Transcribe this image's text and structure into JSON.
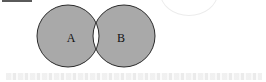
{
  "diagram": {
    "type": "venn",
    "operation": "symmetric-difference",
    "sets": [
      {
        "id": "A",
        "label": "A",
        "cx": 68,
        "cy": 36,
        "r": 31,
        "label_x": 71,
        "label_y": 42
      },
      {
        "id": "B",
        "label": "B",
        "cx": 124,
        "cy": 36,
        "r": 31,
        "label_x": 121,
        "label_y": 42
      }
    ],
    "shaded_regions": [
      "A only",
      "B only"
    ],
    "unshaded_regions": [
      "A ∩ B"
    ],
    "colors": {
      "fill": "#a9a9a9",
      "intersection": "#ffffff",
      "stroke": "#2b2b2b",
      "background": "#ffffff"
    }
  }
}
